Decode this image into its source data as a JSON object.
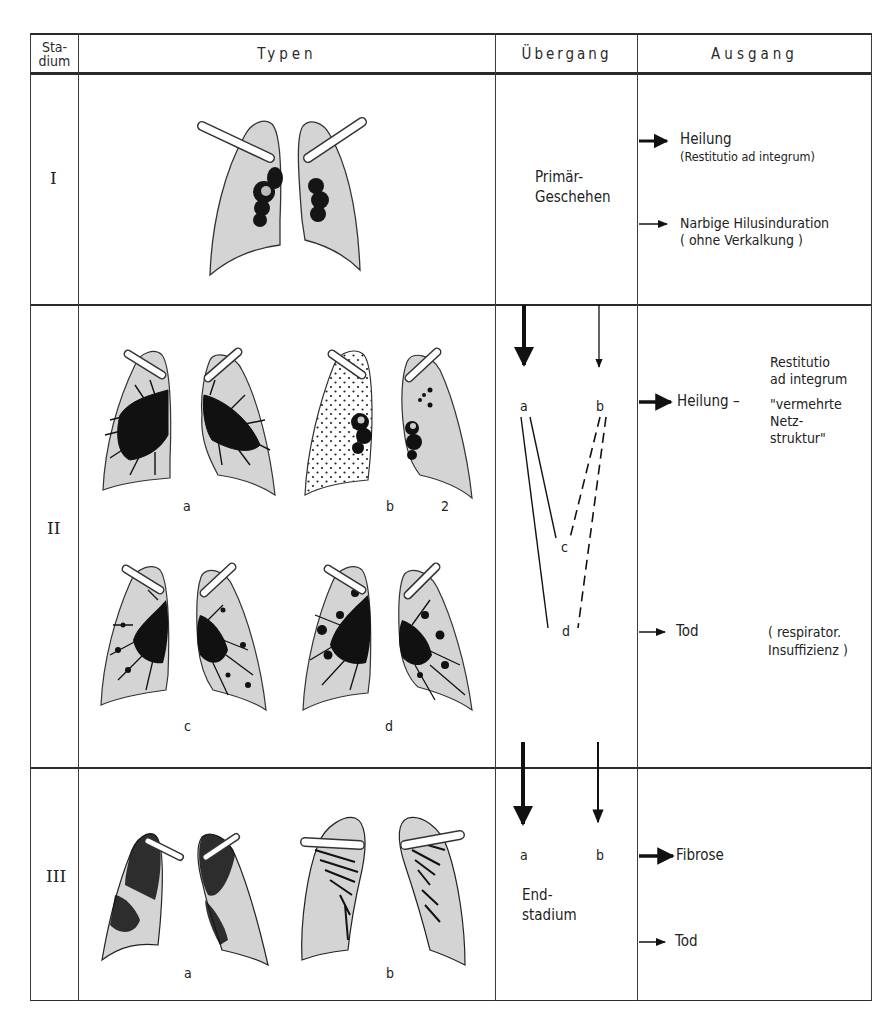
{
  "table": {
    "headers": {
      "stadium": [
        "Sta-",
        "dium"
      ],
      "typen": "Typen",
      "uebergang": "Übergang",
      "ausgang": "Ausgang"
    },
    "rows": [
      {
        "stadium": "I",
        "typen": {
          "figures": [
            {
              "label": "",
              "description": "lungs with bilateral hilar lymph node enlargement"
            }
          ]
        },
        "uebergang": {
          "text": [
            "Primär-",
            "Geschehen"
          ]
        },
        "ausgang": [
          {
            "arrow": "thick",
            "text": "Heilung",
            "note": "(Restitutio ad integrum)"
          },
          {
            "arrow": "thin",
            "text": "Narbige Hilusinduration",
            "note": "( ohne Verkalkung )"
          }
        ]
      },
      {
        "stadium": "II",
        "typen": {
          "figures": [
            {
              "label": "a",
              "description": "reticular hilar-radiating pattern"
            },
            {
              "label": "b",
              "description": "fine dotted miliary pattern with hilar nodes"
            },
            {
              "label": "2",
              "description": ""
            },
            {
              "label": "c",
              "description": "reticulonodular pattern"
            },
            {
              "label": "d",
              "description": "coarse nodular reticular pattern"
            }
          ]
        },
        "uebergang": {
          "nodes": [
            "a",
            "b",
            "c",
            "d"
          ]
        },
        "ausgang": [
          {
            "arrow": "thick",
            "text": "Heilung –",
            "notes": [
              "Restitutio",
              "ad integrum",
              "\"vermehrte",
              "Netz-",
              "struktur\""
            ]
          },
          {
            "arrow": "thin",
            "text": "Tod",
            "notes": [
              "( respirator.",
              "Insuffizienz )"
            ]
          }
        ]
      },
      {
        "stadium": "III",
        "typen": {
          "figures": [
            {
              "label": "a",
              "description": "end-stage fibrotic lungs, shrunken"
            },
            {
              "label": "b",
              "description": "end-stage fibrosis with upper-lobe retraction"
            }
          ]
        },
        "uebergang": {
          "nodes": [
            "a",
            "b"
          ],
          "text": [
            "End-",
            "stadium"
          ]
        },
        "ausgang": [
          {
            "arrow": "thick",
            "text": "Fibrose"
          },
          {
            "arrow": "thin",
            "text": "Tod"
          }
        ]
      }
    ]
  },
  "colors": {
    "line": "#2a2a2a",
    "lung_fill": "#d4d4d4",
    "lung_stroke": "#333333",
    "pattern": "#111111"
  }
}
